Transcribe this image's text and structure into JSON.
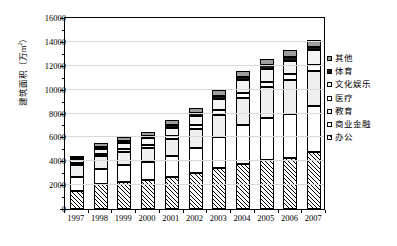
{
  "chart_data": {
    "type": "bar",
    "subtype": "stacked-vertical",
    "title": "",
    "xlabel": "",
    "ylabel": "建筑面积（万m²）",
    "ylim": [
      0,
      16000
    ],
    "ytick_values": [
      0,
      2000,
      4000,
      6000,
      8000,
      10000,
      12000,
      14000,
      16000
    ],
    "ytick_labels": [
      "0",
      "2000",
      "4000",
      "6000",
      "8000",
      "10000",
      "12000",
      "14000",
      "16000"
    ],
    "grid": true,
    "legend_position": "right",
    "categories": [
      "1997",
      "1998",
      "1999",
      "2000",
      "2001",
      "2002",
      "2003",
      "2004",
      "2005",
      "2006",
      "2007"
    ],
    "series": [
      {
        "name": "办公",
        "pattern": "diagonal-hatch",
        "values": [
          1550,
          2100,
          2300,
          2400,
          2700,
          3000,
          3400,
          3800,
          4100,
          4300,
          4800
        ]
      },
      {
        "name": "商业金融",
        "pattern": "white",
        "values": [
          1100,
          1250,
          1400,
          1550,
          1750,
          2100,
          2600,
          3200,
          3500,
          3700,
          3800
        ]
      },
      {
        "name": "教育",
        "pattern": "light-gray",
        "values": [
          1000,
          1050,
          1100,
          1200,
          1400,
          1600,
          1900,
          2300,
          2600,
          2800,
          3000
        ]
      },
      {
        "name": "医疗",
        "pattern": "white-thin",
        "values": [
          150,
          200,
          220,
          250,
          280,
          320,
          380,
          420,
          450,
          480,
          500
        ]
      },
      {
        "name": "文化娱乐",
        "pattern": "dotted",
        "values": [
          250,
          450,
          500,
          550,
          700,
          800,
          950,
          1050,
          1100,
          1150,
          1200
        ]
      },
      {
        "name": "体育",
        "pattern": "black",
        "values": [
          100,
          150,
          170,
          180,
          200,
          220,
          250,
          270,
          280,
          290,
          300
        ]
      },
      {
        "name": "其他",
        "pattern": "gray",
        "values": [
          150,
          300,
          330,
          350,
          400,
          450,
          500,
          550,
          570,
          580,
          600
        ]
      }
    ],
    "totals": [
      4300,
      5500,
      5820,
      6480,
      7430,
      8490,
      9980,
      11590,
      12600,
      13300,
      14200
    ]
  },
  "legend": {
    "items": [
      {
        "label": "其他"
      },
      {
        "label": "体育"
      },
      {
        "label": "文化娱乐"
      },
      {
        "label": "医疗"
      },
      {
        "label": "教育"
      },
      {
        "label": "商业金融"
      },
      {
        "label": "办公"
      }
    ]
  }
}
